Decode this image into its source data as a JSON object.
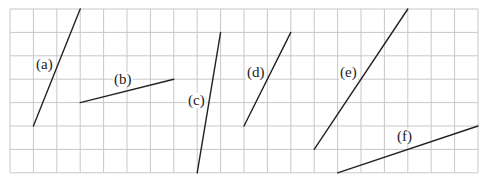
{
  "grid": {
    "origin_x": 10,
    "origin_y": 9,
    "cell": 23.4,
    "cols": 20,
    "rows": 7,
    "line_color": "#c8c8c8"
  },
  "segment_color": "#222222",
  "segments": [
    {
      "id": "a",
      "label": "(a)",
      "from": [
        1,
        5
      ],
      "to": [
        3,
        0
      ],
      "label_pos": [
        35,
        57
      ]
    },
    {
      "id": "b",
      "label": "(b)",
      "from": [
        3,
        4
      ],
      "to": [
        7,
        3
      ],
      "label_pos": [
        113,
        72
      ]
    },
    {
      "id": "c",
      "label": "(c)",
      "from": [
        8,
        7
      ],
      "to": [
        9,
        1
      ],
      "label_pos": [
        187,
        93
      ]
    },
    {
      "id": "d",
      "label": "(d)",
      "from": [
        10,
        5
      ],
      "to": [
        12,
        1
      ],
      "label_pos": [
        246,
        65
      ]
    },
    {
      "id": "e",
      "label": "(e)",
      "from": [
        13,
        6
      ],
      "to": [
        17,
        0
      ],
      "label_pos": [
        339,
        65
      ]
    },
    {
      "id": "f",
      "label": "(f)",
      "from": [
        14,
        7
      ],
      "to": [
        20,
        5
      ],
      "label_pos": [
        396,
        129
      ]
    }
  ]
}
